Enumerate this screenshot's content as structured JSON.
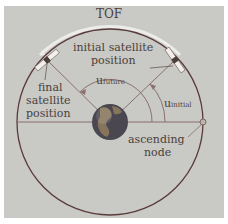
{
  "diagram": {
    "labels": {
      "tof": "TOF",
      "initial_line1": "initial satellite",
      "initial_line2": "position",
      "final_line1": "final",
      "final_line2": "satellite",
      "final_line3": "position",
      "u_future_main": "u",
      "u_future_sub": "future",
      "u_initial_main": "u",
      "u_initial_sub": "initial",
      "ascending_line1": "ascending",
      "ascending_line2": "node"
    },
    "colors": {
      "background": "#c9c9c6",
      "orbit": "#5a3a3a",
      "lines": "#8a6f6f",
      "tof_arc": "#e8e4e2",
      "text": "#4a3f3a",
      "earth_ocean": "#3a3a40",
      "earth_land": "#7b6a52"
    }
  }
}
